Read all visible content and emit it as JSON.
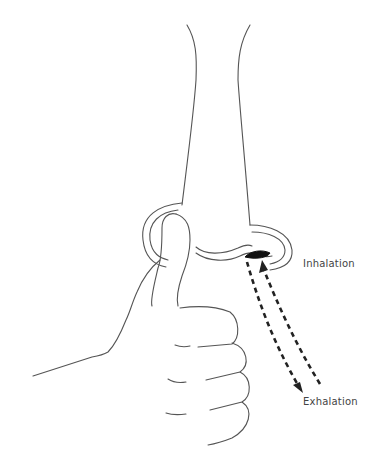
{
  "figure": {
    "labels": {
      "inhalation": "Inhalation",
      "exhalation": "Exhalation"
    },
    "colors": {
      "stroke": "#444444",
      "arrow": "#222222",
      "text": "#444444",
      "background": "#ffffff"
    }
  }
}
